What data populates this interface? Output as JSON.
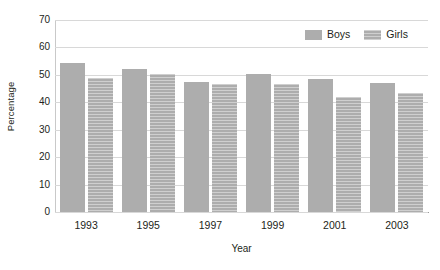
{
  "chart_data": {
    "type": "bar",
    "title": "",
    "subtitle": "",
    "xlabel": "Year",
    "ylabel": "Percentage",
    "categories": [
      "1993",
      "1995",
      "1997",
      "1999",
      "2001",
      "2003"
    ],
    "series": [
      {
        "name": "Boys",
        "values": [
          54.5,
          52.0,
          47.5,
          50.5,
          48.5,
          47.0
        ],
        "color": "#adadad",
        "pattern": "solid"
      },
      {
        "name": "Girls",
        "values": [
          49.0,
          50.5,
          46.5,
          46.5,
          42.0,
          43.5
        ],
        "color": "#adadad",
        "pattern": "horizontal-lines"
      }
    ],
    "ylim": [
      0,
      70
    ],
    "yticks": [
      0,
      10,
      20,
      30,
      40,
      50,
      60,
      70
    ],
    "ytick_labels": [
      "0",
      "10",
      "20",
      "30",
      "40",
      "50",
      "60",
      "70"
    ],
    "grid": true,
    "grid_axis": "y",
    "legend_position": "top-right",
    "legend": [
      "Boys",
      "Girls"
    ],
    "annotations": []
  },
  "colors": {
    "bar_fill": "#adadad",
    "gridline": "#d8d8d8",
    "axis_line": "#9b9b9b",
    "text": "#231f20",
    "background": "#ffffff"
  }
}
